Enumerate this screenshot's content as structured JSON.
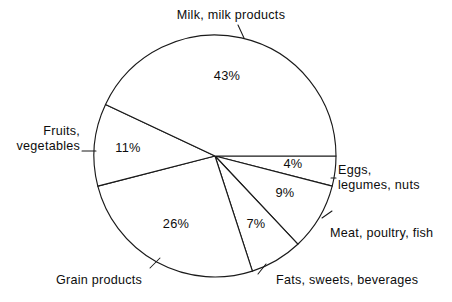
{
  "chart_data": {
    "type": "pie",
    "title": "",
    "subtitle": "",
    "xlabel": "",
    "ylabel": "",
    "grid": false,
    "legend_position": "none",
    "units": "percent",
    "total": 100,
    "start_angle_deg": 0,
    "direction": "clockwise",
    "center": {
      "x": 215,
      "y": 156
    },
    "radius": 121,
    "categories": [
      "Eggs, legumes, nuts",
      "Meat, poultry, fish",
      "Fats, sweets, beverages",
      "Grain products",
      "Fruits, vegetables",
      "Milk, milk products"
    ],
    "values": [
      4,
      9,
      7,
      26,
      11,
      43
    ],
    "slices": [
      {
        "label": "Eggs, legumes, nuts",
        "value": 4,
        "value_text": "4%",
        "label_line1": "Eggs,",
        "label_line2": "legumes, nuts",
        "start_deg": 0,
        "end_deg": 14.4,
        "pct_x": 293,
        "pct_y": 164,
        "label_x": 338,
        "label_y": 163,
        "align": "left"
      },
      {
        "label": "Meat, poultry, fish",
        "value": 9,
        "value_text": "9%",
        "label_line1": "Meat, poultry, fish",
        "label_line2": "",
        "start_deg": 14.4,
        "end_deg": 46.8,
        "pct_x": 285,
        "pct_y": 193,
        "label_x": 330,
        "label_y": 226,
        "align": "left"
      },
      {
        "label": "Fats, sweets, beverages",
        "value": 7,
        "value_text": "7%",
        "label_line1": "Fats, sweets, beverages",
        "label_line2": "",
        "start_deg": 46.8,
        "end_deg": 72.0,
        "pct_x": 256,
        "pct_y": 224,
        "label_x": 276,
        "label_y": 273,
        "align": "left"
      },
      {
        "label": "Grain products",
        "value": 26,
        "value_text": "26%",
        "label_line1": "Grain products",
        "label_line2": "",
        "start_deg": 72.0,
        "end_deg": 165.6,
        "pct_x": 176,
        "pct_y": 224,
        "label_x": 56,
        "label_y": 273,
        "align": "left"
      },
      {
        "label": "Fruits, vegetables",
        "value": 11,
        "value_text": "11%",
        "label_line1": "Fruits,",
        "label_line2": "vegetables",
        "start_deg": 165.6,
        "end_deg": 205.2,
        "pct_x": 128,
        "pct_y": 148,
        "label_x": 80,
        "label_y": 124,
        "align": "right"
      },
      {
        "label": "Milk, milk products",
        "value": 43,
        "value_text": "43%",
        "label_line1": "Milk, milk products",
        "label_line2": "",
        "start_deg": 205.2,
        "end_deg": 360.0,
        "pct_x": 227,
        "pct_y": 76,
        "label_x": 231,
        "label_y": 8,
        "align": "center"
      }
    ],
    "leader_lines": [
      {
        "name": "milk",
        "x1": 244,
        "y1": 38,
        "x2": 238,
        "y2": 25
      },
      {
        "name": "fruits-vegetables",
        "x1": 96,
        "y1": 151,
        "x2": 82,
        "y2": 151
      },
      {
        "name": "grain-products",
        "x1": 150,
        "y1": 268,
        "x2": 160,
        "y2": 258
      },
      {
        "name": "fats-sweets-beverages",
        "x1": 258,
        "y1": 274,
        "x2": 266,
        "y2": 264
      },
      {
        "name": "meat-poultry-fish",
        "x1": 322,
        "y1": 218,
        "x2": 332,
        "y2": 211
      },
      {
        "name": "eggs-legumes-nuts",
        "x1": 331,
        "y1": 178,
        "x2": 336,
        "y2": 178
      }
    ],
    "colors": {
      "stroke": "#1a1a1a",
      "fill": "#ffffff",
      "text": "#0d0d0d",
      "background": "#ffffff"
    }
  }
}
